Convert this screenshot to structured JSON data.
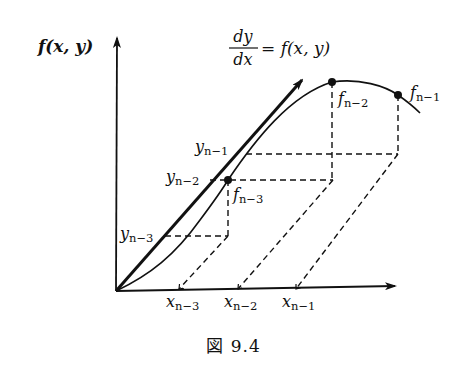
{
  "figure": {
    "caption": "図 9.4",
    "equation": {
      "numerator": "dy",
      "denominator": "dx",
      "rhs": "= f(x, y)"
    },
    "y_axis_label": "f(x, y)",
    "axes": {
      "origin": [
        116,
        291
      ],
      "y_axis_top": [
        117,
        38
      ],
      "x_axis_end": [
        395,
        286
      ]
    },
    "thick_arrow": {
      "from": [
        116,
        291
      ],
      "to": [
        302,
        80
      ]
    },
    "curve": {
      "path": "M116,291 C150,275 175,255 200,220 C215,200 222,190 228,180 C255,140 290,95 332,82 C360,78 385,86 398,95 C408,102 414,107 420,113"
    },
    "points": [
      {
        "id": "f_n-3",
        "base": "f",
        "sub": "n−3",
        "at": [
          228,
          180
        ],
        "label_pos": [
          233,
          200
        ]
      },
      {
        "id": "f_n-2",
        "base": "f",
        "sub": "n−2",
        "at": [
          332,
          82
        ],
        "label_pos": [
          338,
          104
        ]
      },
      {
        "id": "f_n-1",
        "base": "f",
        "sub": "n−1",
        "at": [
          398,
          95
        ],
        "label_pos": [
          410,
          98
        ]
      }
    ],
    "y_labels": [
      {
        "base": "y",
        "sub": "n−1",
        "pos": [
          195,
          152
        ]
      },
      {
        "base": "y",
        "sub": "n−2",
        "pos": [
          166,
          182
        ]
      },
      {
        "base": "y",
        "sub": "n−3",
        "pos": [
          120,
          239
        ]
      }
    ],
    "x_labels": [
      {
        "base": "x",
        "sub": "n−3",
        "pos": [
          166,
          307
        ]
      },
      {
        "base": "x",
        "sub": "n−2",
        "pos": [
          224,
          307
        ]
      },
      {
        "base": "x",
        "sub": "n−1",
        "pos": [
          282,
          307
        ]
      }
    ],
    "dashed_lines": [
      [
        [
          246,
          154
        ],
        [
          398,
          154
        ]
      ],
      [
        [
          398,
          95
        ],
        [
          398,
          154
        ]
      ],
      [
        [
          332,
          82
        ],
        [
          332,
          180
        ]
      ],
      [
        [
          210,
          180
        ],
        [
          333,
          180
        ]
      ],
      [
        [
          165,
          236
        ],
        [
          228,
          236
        ]
      ],
      [
        [
          228,
          180
        ],
        [
          228,
          236
        ]
      ],
      [
        [
          228,
          236
        ],
        [
          179,
          289
        ]
      ],
      [
        [
          333,
          180
        ],
        [
          238,
          289
        ]
      ],
      [
        [
          398,
          154
        ],
        [
          296,
          289
        ]
      ]
    ],
    "ticks": [
      [
        179,
        289
      ],
      [
        238,
        289
      ],
      [
        296,
        289
      ]
    ]
  }
}
